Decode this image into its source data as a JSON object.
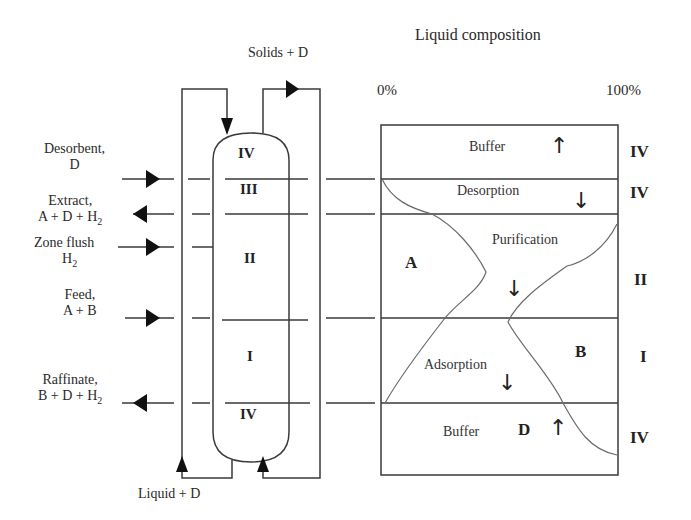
{
  "title": "Liquid composition",
  "axis": {
    "min_label": "0%",
    "max_label": "100%"
  },
  "column": {
    "top_stream": "Solids + D",
    "bottom_stream": "Liquid + D",
    "zones_in_column": [
      "IV",
      "III",
      "II",
      "I",
      "IV"
    ]
  },
  "streams": [
    {
      "name": "Desorbent,",
      "sub": "D",
      "direction": "in"
    },
    {
      "name": "Extract,",
      "sub": "A + D + H",
      "subscript": "2",
      "direction": "out"
    },
    {
      "name": "Zone flush",
      "sub": "H",
      "subscript": "2",
      "direction": "in"
    },
    {
      "name": "Feed,",
      "sub": "A + B",
      "direction": "in"
    },
    {
      "name": "Raffinate,",
      "sub": "B + D + H",
      "subscript": "2",
      "direction": "out"
    }
  ],
  "profile": {
    "regions": [
      {
        "label": "Buffer",
        "arrow": "up",
        "zone": "IV"
      },
      {
        "label": "Desorption",
        "arrow": "down",
        "zone": "IV"
      },
      {
        "label": "Purification",
        "arrow": "down",
        "zone": "II"
      },
      {
        "label": "Adsorption",
        "arrow": "down",
        "zone": "I"
      },
      {
        "label": "Buffer",
        "arrow": "up",
        "zone": "IV"
      }
    ],
    "components": {
      "a": "A",
      "b": "B",
      "d": "D"
    }
  },
  "glyphs": {
    "up_arrow": "↑",
    "down_arrow": "↓"
  },
  "colors": {
    "line": "#333333",
    "curve": "#666666",
    "background": "#ffffff"
  }
}
